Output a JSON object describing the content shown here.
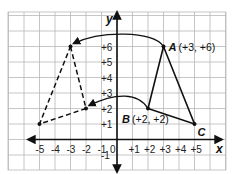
{
  "diagram": {
    "type": "coordinate-plane-reflection",
    "axes": {
      "x_label": "x",
      "y_label": "y",
      "x_ticks": [
        "-5",
        "-4",
        "-3",
        "-2",
        "-1",
        "0",
        "+1",
        "+2",
        "+3",
        "+4",
        "+5"
      ],
      "y_ticks": [
        "+6",
        "+5",
        "+4",
        "+3",
        "+2",
        "+1",
        "-1"
      ],
      "x_range": [
        -7,
        7
      ],
      "y_range": [
        -2,
        8
      ]
    },
    "original_triangle": {
      "style": "solid",
      "vertices": [
        {
          "name": "A",
          "x": 3,
          "y": 6,
          "label": "A",
          "coords": "(+3, +6)"
        },
        {
          "name": "B",
          "x": 2,
          "y": 2,
          "label": "B",
          "coords": "(+2, +2)"
        },
        {
          "name": "C",
          "x": 5,
          "y": 1,
          "label": "C",
          "coords": ""
        }
      ]
    },
    "image_triangle": {
      "style": "dashed",
      "vertices": [
        {
          "x": -3,
          "y": 6
        },
        {
          "x": -2,
          "y": 2
        },
        {
          "x": -5,
          "y": 1
        }
      ]
    },
    "arrows": [
      {
        "from": "A",
        "to": [
          -3,
          6
        ],
        "style": "curved"
      },
      {
        "from": "B",
        "to": [
          -2,
          2
        ],
        "style": "curved"
      }
    ]
  }
}
